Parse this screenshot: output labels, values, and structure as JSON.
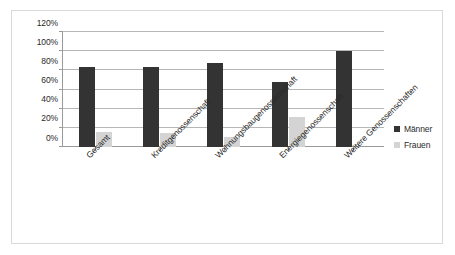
{
  "chart_data": {
    "type": "bar",
    "title": "",
    "subtitle": "",
    "xlabel": "",
    "ylabel": "",
    "ylim": [
      0,
      120
    ],
    "grid": true,
    "legend_position": "right",
    "y_ticks": [
      "0%",
      "20%",
      "40%",
      "60%",
      "80%",
      "100%",
      "120%"
    ],
    "y_tick_values": [
      0,
      20,
      40,
      60,
      80,
      100,
      120
    ],
    "categories": [
      "Gesamt",
      "Kreditgenossenschaft",
      "Wohnungsbaugenossenschaft",
      "Energiegenossenschaft",
      "Weitere Genossenschaften"
    ],
    "series": [
      {
        "name": "Männer",
        "color": "#333333",
        "values": [
          83,
          84,
          88,
          68,
          100
        ]
      },
      {
        "name": "Frauen",
        "color": "#d4d4d4",
        "values": [
          16,
          15,
          10,
          31,
          0
        ]
      }
    ]
  },
  "legend": {
    "entries": [
      {
        "label": "Männer"
      },
      {
        "label": "Frauen"
      }
    ]
  },
  "colors": {
    "maenner": "#333333",
    "frauen": "#d4d4d4",
    "gridline": "#b6b6b6",
    "axis": "#9a9a9a",
    "frame": "#d9d9d9",
    "text": "#2a2a2a"
  }
}
